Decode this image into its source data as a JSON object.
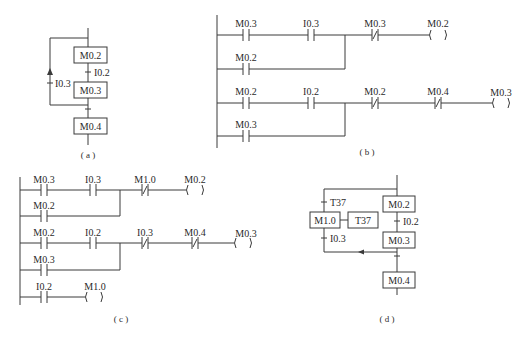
{
  "figure": {
    "a": {
      "caption": "( a )",
      "steps": [
        "M0.2",
        "M0.3",
        "M0.4"
      ],
      "transitions": [
        "I0.2",
        "I0.3"
      ]
    },
    "b": {
      "caption": "( b )",
      "rung1": {
        "contacts": [
          "M0.3",
          "I0.3"
        ],
        "parallel": "M0.2",
        "nc": [
          "M0.3"
        ],
        "coil": "M0.2"
      },
      "rung2": {
        "contacts": [
          "M0.2",
          "I0.2"
        ],
        "parallel": "M0.3",
        "nc": [
          "M0.2",
          "M0.4"
        ],
        "coil": "M0.3"
      }
    },
    "c": {
      "caption": "( c )",
      "rung1": {
        "contacts": [
          "M0.3",
          "I0.3"
        ],
        "parallel": "M0.2",
        "nc": [
          "M1.0"
        ],
        "coil": "M0.2"
      },
      "rung2": {
        "contacts": [
          "M0.2",
          "I0.2"
        ],
        "parallel": "M0.3",
        "nc": [
          "I0.3",
          "M0.4"
        ],
        "coil": "M0.3"
      },
      "rung3": {
        "contacts": [
          "I0.2"
        ],
        "coil": "M1.0"
      }
    },
    "d": {
      "caption": "( d )",
      "steps": [
        "M0.2",
        "M0.3",
        "M0.4",
        "M1.0"
      ],
      "action": "T37",
      "transitions": [
        "I0.2",
        "T37",
        "I0.3"
      ]
    }
  }
}
